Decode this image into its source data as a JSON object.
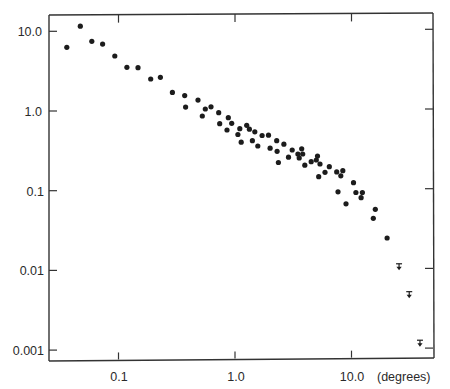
{
  "chart_data": {
    "type": "scatter",
    "title": "",
    "xlabel": "(degrees)",
    "ylabel": "",
    "xscale": "log",
    "yscale": "log",
    "xlim": [
      0.028,
      48
    ],
    "ylim": [
      0.00075,
      14.5
    ],
    "grid": false,
    "legend": null,
    "x_ticks": [
      0.1,
      1.0,
      10.0
    ],
    "x_tick_labels": [
      "0.1",
      "1.0",
      "10.0"
    ],
    "y_ticks": [
      10.0,
      1.0,
      0.1,
      0.01,
      0.001
    ],
    "y_tick_labels": [
      "10.0",
      "1.0",
      "0.1",
      "0.01",
      "0.001"
    ],
    "series": [
      {
        "name": "measurements",
        "marker": "filled-circle",
        "points": [
          [
            0.036,
            6.3
          ],
          [
            0.047,
            11.6
          ],
          [
            0.059,
            7.5
          ],
          [
            0.073,
            6.9
          ],
          [
            0.093,
            4.9
          ],
          [
            0.118,
            3.53
          ],
          [
            0.147,
            3.49
          ],
          [
            0.189,
            2.52
          ],
          [
            0.229,
            2.65
          ],
          [
            0.29,
            1.71
          ],
          [
            0.37,
            1.56
          ],
          [
            0.377,
            1.12
          ],
          [
            0.481,
            1.37
          ],
          [
            0.524,
            0.866
          ],
          [
            0.556,
            1.06
          ],
          [
            0.622,
            1.13
          ],
          [
            0.724,
            0.952
          ],
          [
            0.739,
            0.693
          ],
          [
            0.854,
            0.578
          ],
          [
            0.876,
            0.824
          ],
          [
            0.937,
            0.701
          ],
          [
            1.06,
            0.507
          ],
          [
            1.1,
            0.6
          ],
          [
            1.13,
            0.406
          ],
          [
            1.26,
            0.662
          ],
          [
            1.33,
            0.591
          ],
          [
            1.41,
            0.424
          ],
          [
            1.48,
            0.548
          ],
          [
            1.57,
            0.364
          ],
          [
            1.71,
            0.493
          ],
          [
            1.94,
            0.497
          ],
          [
            2.0,
            0.341
          ],
          [
            2.28,
            0.424
          ],
          [
            2.3,
            0.312
          ],
          [
            2.36,
            0.226
          ],
          [
            2.63,
            0.383
          ],
          [
            2.88,
            0.263
          ],
          [
            3.1,
            0.324
          ],
          [
            3.47,
            0.289
          ],
          [
            3.56,
            0.257
          ],
          [
            3.74,
            0.336
          ],
          [
            3.81,
            0.289
          ],
          [
            3.97,
            0.209
          ],
          [
            4.51,
            0.231
          ],
          [
            4.99,
            0.243
          ],
          [
            5.11,
            0.272
          ],
          [
            5.37,
            0.216
          ],
          [
            5.23,
            0.15
          ],
          [
            5.92,
            0.17
          ],
          [
            6.45,
            0.2
          ],
          [
            7.46,
            0.172
          ],
          [
            8.09,
            0.154
          ],
          [
            8.42,
            0.178
          ],
          [
            7.66,
            0.0969
          ],
          [
            8.97,
            0.0685
          ],
          [
            10.4,
            0.126
          ],
          [
            10.9,
            0.0949
          ],
          [
            12.1,
            0.0817
          ],
          [
            12.4,
            0.0949
          ],
          [
            16.0,
            0.0585
          ],
          [
            15.4,
            0.0451
          ],
          [
            20.2,
            0.0255
          ]
        ]
      },
      {
        "name": "upper limits",
        "marker": "upper-limit-arrow",
        "points": [
          [
            25.6,
            0.0111
          ],
          [
            31.3,
            0.00496
          ],
          [
            38.7,
            0.00122
          ]
        ]
      }
    ]
  },
  "axis": {
    "x_unit_label": "(degrees)",
    "x_labels": [
      "0.1",
      "1.0",
      "10.0"
    ],
    "y_labels": [
      "10.0",
      "1.0",
      "0.1",
      "0.01",
      "0.001"
    ]
  }
}
